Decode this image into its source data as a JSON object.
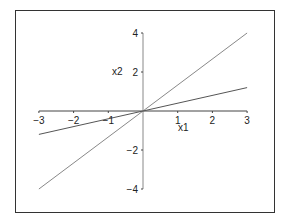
{
  "chart_data": {
    "type": "line",
    "title": "",
    "xlabel": "x1",
    "ylabel": "x2",
    "xlim": [
      -3,
      3
    ],
    "ylim": [
      -4,
      4
    ],
    "xticks": [
      -3,
      -2,
      -1,
      1,
      2,
      3
    ],
    "yticks": [
      -4,
      -2,
      2,
      4
    ],
    "grid": false,
    "legend": null,
    "axes_style": "crossing-at-origin",
    "series": [
      {
        "name": "steep-line",
        "x": [
          -3,
          3
        ],
        "y": [
          -4,
          4
        ],
        "color": "#888888"
      },
      {
        "name": "shallow-line",
        "x": [
          -3,
          3
        ],
        "y": [
          -1.2,
          1.2
        ],
        "color": "#555555"
      }
    ]
  },
  "labels": {
    "xlabel": "x1",
    "ylabel": "x2",
    "xticks": [
      "−3",
      "−2",
      "−1",
      "1",
      "2",
      "3"
    ],
    "yticks": [
      "4",
      "2",
      "−2",
      "−4"
    ]
  }
}
